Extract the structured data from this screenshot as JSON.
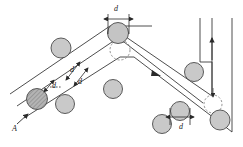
{
  "figure": {
    "background_color": "#ffffff",
    "line_color": "#3a3a3a",
    "dashed_color": "#7a7a7a",
    "particle_fill": "#c9c9c9",
    "particle_fill_dark": "#9a9a9a",
    "particle_stroke": "#4a4a4a",
    "label_color": "#1a1a1a"
  },
  "labels": {
    "inlet": "A",
    "gap_top": "d",
    "gap_left_upper": "d",
    "gap_left_mid": "d",
    "gap_left_lower": "d",
    "gap_bottom_right": "d"
  },
  "annotations": [
    {
      "name": "inlet-marker",
      "text": "A",
      "x": 12,
      "y": 127,
      "kind": "flow-entry"
    },
    {
      "name": "dimension-top",
      "text": "d",
      "x": 113,
      "y": 8,
      "kind": "diameter"
    },
    {
      "name": "dimension-left-upper",
      "text": "d",
      "x": 70,
      "y": 67,
      "kind": "diameter"
    },
    {
      "name": "dimension-left-mid",
      "text": "d",
      "x": 77,
      "y": 78,
      "kind": "diameter"
    },
    {
      "name": "dimension-left-lower",
      "text": "d",
      "x": 51,
      "y": 88,
      "kind": "diameter"
    },
    {
      "name": "dimension-bottom-right",
      "text": "d",
      "x": 180,
      "y": 127,
      "kind": "diameter"
    }
  ],
  "particles": [
    {
      "name": "particle-apex",
      "cx": 118,
      "cy": 33,
      "r": 10.5,
      "shade": "dark"
    },
    {
      "name": "particle-upper-left",
      "cx": 61,
      "cy": 48,
      "r": 10.0,
      "shade": "light"
    },
    {
      "name": "particle-left-arm",
      "cx": 37,
      "cy": 99,
      "r": 10.5,
      "shade": "dark"
    },
    {
      "name": "particle-left-arm-2",
      "cx": 65,
      "cy": 104,
      "r": 9.5,
      "shade": "light"
    },
    {
      "name": "particle-center",
      "cx": 113,
      "cy": 89,
      "r": 9.5,
      "shade": "light"
    },
    {
      "name": "particle-right-upper",
      "cx": 194,
      "cy": 72,
      "r": 9.5,
      "shade": "light"
    },
    {
      "name": "particle-right-arm",
      "cx": 180,
      "cy": 111,
      "r": 9.5,
      "shade": "light"
    },
    {
      "name": "particle-lower-left",
      "cx": 162,
      "cy": 124,
      "r": 9.5,
      "shade": "light"
    },
    {
      "name": "particle-corner",
      "cx": 220,
      "cy": 120,
      "r": 10.0,
      "shade": "light"
    }
  ],
  "ghost_particles": [
    {
      "name": "ghost-apex",
      "cx": 120,
      "cy": 50,
      "r": 10.0
    },
    {
      "name": "ghost-corner",
      "cx": 213,
      "cy": 104,
      "r": 9.0
    }
  ],
  "flow_arrows": [
    {
      "name": "flow-arrow-inlet",
      "direction": "up-right"
    },
    {
      "name": "flow-arrow-left-arm",
      "direction": "up-right"
    },
    {
      "name": "flow-arrow-right-arm",
      "direction": "down-right"
    },
    {
      "name": "flow-arrow-vertical",
      "direction": "up"
    }
  ]
}
